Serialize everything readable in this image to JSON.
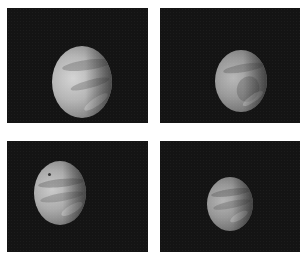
{
  "figure": {
    "layout": "2x2 grid of planetary photographs",
    "background": "#ffffff",
    "panel_color": "#141414",
    "panels": [
      {
        "id": "top-left",
        "subject": "Venus cloud tops, gibbous phase",
        "planet_light": "#c9c9c9",
        "planet_dark": "#6e6e6e"
      },
      {
        "id": "top-right",
        "subject": "Venus cloud tops, gibbous phase",
        "planet_light": "#a9a9a9",
        "planet_dark": "#5a5a5a"
      },
      {
        "id": "bottom-left",
        "subject": "Venus cloud tops with banded structure",
        "planet_light": "#bdbdbd",
        "planet_dark": "#626262"
      },
      {
        "id": "bottom-right",
        "subject": "Venus cloud tops, smaller disk",
        "planet_light": "#a5a5a5",
        "planet_dark": "#575757"
      }
    ]
  }
}
